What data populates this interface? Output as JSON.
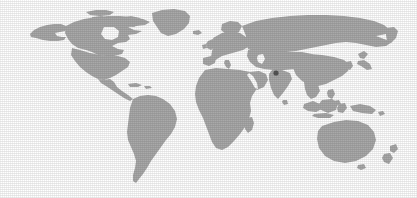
{
  "figure": {
    "kind": "world-locator-map",
    "width": 417,
    "height": 198,
    "background_color": "#ffffff",
    "alt_text": "World map with a single highlighted location marker"
  },
  "map": {
    "projection": "equirectangular",
    "land_color": "#a9a9a9",
    "ocean_color": "#ffffff",
    "border_color": "#ffffff",
    "content_bounds": {
      "left": 28,
      "top": 8,
      "right": 400,
      "bottom": 185
    },
    "regions": [
      {
        "name": "north-america"
      },
      {
        "name": "south-america"
      },
      {
        "name": "greenland"
      },
      {
        "name": "europe"
      },
      {
        "name": "africa"
      },
      {
        "name": "asia"
      },
      {
        "name": "southeast-asia-islands"
      },
      {
        "name": "australia"
      },
      {
        "name": "new-zealand"
      },
      {
        "name": "madagascar"
      },
      {
        "name": "japan"
      },
      {
        "name": "british-isles"
      },
      {
        "name": "iceland"
      }
    ]
  },
  "marker": {
    "label": "Nepal",
    "region_hint": "Northern India / Himalaya",
    "color": "#555555",
    "radius": 2.6,
    "x": 276,
    "y": 73
  }
}
